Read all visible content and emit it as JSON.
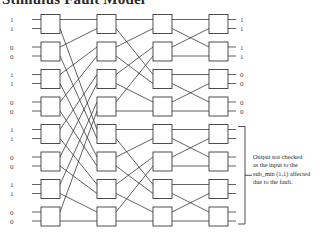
{
  "title": "Stimulus Fault Model",
  "network": {
    "stages": 4,
    "boxes_per_stage": 8,
    "inputs": [
      "1",
      "1",
      "0",
      "0",
      "1",
      "1",
      "0",
      "0",
      "1",
      "1",
      "0",
      "0",
      "1",
      "1",
      "0",
      "0"
    ],
    "outputs": [
      "1",
      "1",
      "1",
      "1",
      "0",
      "0",
      "0",
      "0",
      "",
      "",
      "",
      "",
      "",
      "",
      "",
      ""
    ],
    "stage_x": [
      41,
      97,
      153,
      209
    ],
    "box_w": 19,
    "box_h": 19,
    "row_top0": 14.5,
    "row_pitch": 27.5,
    "interconnect": [
      "perfect-shuffle-16",
      "perfect-shuffle-8",
      "perfect-shuffle-4"
    ],
    "colors": {
      "line": "#3a3a3a",
      "box_fill": "#ffffff"
    }
  },
  "bracket": {
    "from_row": 8,
    "to_row": 15
  },
  "annotation": {
    "lines": [
      "Output  not checked",
      "as the input  to the",
      "sub_min (1,1) affected",
      "due to the fault."
    ]
  }
}
